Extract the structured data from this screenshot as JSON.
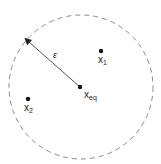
{
  "diagram": {
    "boundary": {
      "shape": "dashed-circle",
      "cx": 81,
      "cy": 87,
      "r": 72,
      "color": "#8a8a8a"
    },
    "radius_label": "ε",
    "points": [
      {
        "id": "x_eq",
        "base": "x",
        "sub": "eq",
        "x": 80,
        "y": 87
      },
      {
        "id": "x_1",
        "base": "x",
        "sub": "1",
        "x": 101,
        "y": 51
      },
      {
        "id": "x_2",
        "base": "x",
        "sub": "2",
        "x": 28,
        "y": 99
      }
    ],
    "arrow": {
      "from": [
        80,
        87
      ],
      "to": [
        28,
        41
      ],
      "color": "#444444"
    }
  }
}
